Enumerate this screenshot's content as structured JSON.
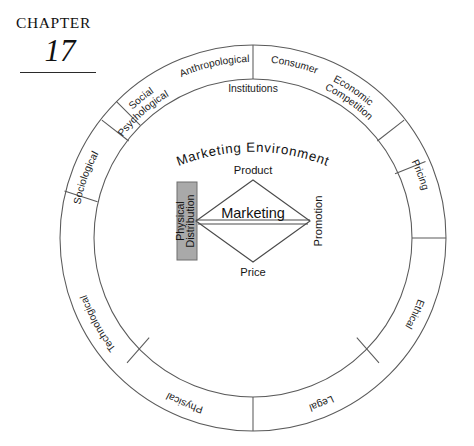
{
  "chapter": {
    "label": "CHAPTER",
    "number": "17"
  },
  "diagram": {
    "environment_label": "Marketing Environment",
    "institutions_label": "Institutions",
    "outer_ring_segments": [
      {
        "id": "social-psychological",
        "line1": "Social",
        "line2": "Psychological"
      },
      {
        "id": "anthropological",
        "line1": "Anthropological",
        "line2": ""
      },
      {
        "id": "consumer",
        "line1": "Consumer",
        "line2": ""
      },
      {
        "id": "economic-competition",
        "line1": "Economic",
        "line2": "Competition"
      },
      {
        "id": "pricing",
        "line1": "Pricing",
        "line2": ""
      },
      {
        "id": "ethical",
        "line1": "Ethical",
        "line2": ""
      },
      {
        "id": "legal",
        "line1": "Legal",
        "line2": ""
      },
      {
        "id": "physical",
        "line1": "Physical",
        "line2": ""
      },
      {
        "id": "technological",
        "line1": "Technological",
        "line2": ""
      },
      {
        "id": "sociological",
        "line1": "Sociological",
        "line2": ""
      }
    ],
    "center": {
      "core_label": "Marketing",
      "top_label": "Product",
      "bottom_label": "Price",
      "right_label": "Promotion",
      "left_label_line1": "Physical",
      "left_label_line2": "Distribution"
    },
    "colors": {
      "stroke": "#5a5a5a",
      "highlight_box": "#a9a9a9",
      "text": "#1a1a1a",
      "background": "#ffffff"
    }
  }
}
